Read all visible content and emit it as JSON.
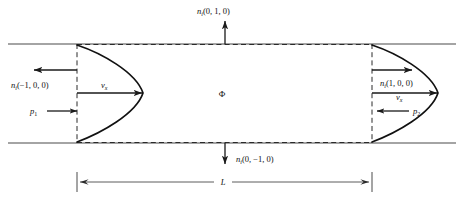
{
  "figure": {
    "type": "engineering-diagram",
    "background_color": "#ffffff",
    "line_color": "#1a1a1a"
  },
  "labels": {
    "normal_top": {
      "symbol": "n",
      "subscript": "i",
      "args": "(0, 1, 0)"
    },
    "normal_bottom": {
      "symbol": "n",
      "subscript": "i",
      "args": "(0, −1, 0)"
    },
    "normal_left": {
      "symbol": "n",
      "subscript": "i",
      "args": "(−1, 0, 0)"
    },
    "normal_right": {
      "symbol": "n",
      "subscript": "i",
      "args": "(1, 0, 0)"
    },
    "velocity_left": {
      "symbol": "v",
      "subscript": "x"
    },
    "velocity_right": {
      "symbol": "v",
      "subscript": "x"
    },
    "pressure_left": {
      "symbol": "p",
      "subscript": "1"
    },
    "pressure_right": {
      "symbol": "p",
      "subscript": "2"
    },
    "control_volume": {
      "symbol": "Φ"
    },
    "length": {
      "symbol": "L"
    }
  },
  "geometry": {
    "wall_top_y": 44,
    "wall_bottom_y": 143,
    "wall_left_x": 8,
    "wall_right_x": 456,
    "cv_left_x": 77,
    "cv_right_x": 372,
    "centerline_y": 93,
    "dimension_line_y": 182,
    "profile_peak_left_x": 143,
    "profile_peak_right_x": 438
  },
  "annotations": {
    "top_arrow": {
      "from_y": 44,
      "to_y": 22,
      "direction": "up"
    },
    "bottom_arrow": {
      "from_y": 143,
      "to_y": 165,
      "direction": "down"
    },
    "left_normal_arrow": {
      "from_x": 77,
      "to_x": 33,
      "direction": "left"
    },
    "right_normal_arrow": {
      "from_x": 372,
      "to_x": 414,
      "direction": "right"
    },
    "left_pressure_arrow": {
      "from_x": 50,
      "to_x": 77,
      "direction": "right"
    },
    "right_pressure_arrow": {
      "from_x": 412,
      "to_x": 378,
      "direction": "left"
    }
  }
}
